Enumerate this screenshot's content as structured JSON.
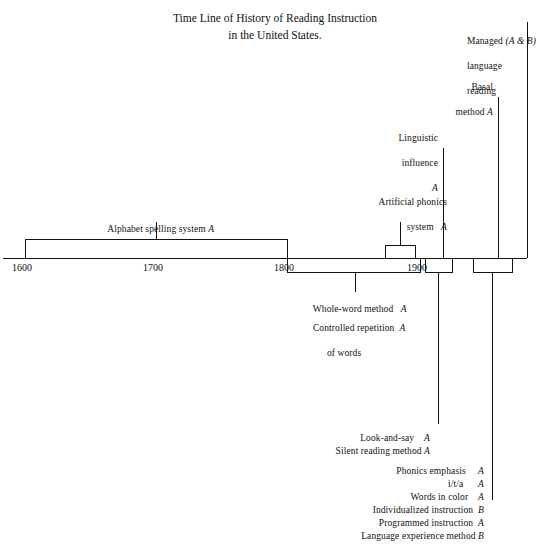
{
  "figure": {
    "title_line1": "Time Line of History of Reading Instruction",
    "title_line2": "in the United States."
  },
  "axis": {
    "ticks": [
      {
        "label": "1600",
        "x": 25
      },
      {
        "label": "1700",
        "x": 156
      },
      {
        "label": "1800",
        "x": 287
      },
      {
        "label": "1900",
        "x": 420
      }
    ]
  },
  "above_axis_entries": [
    {
      "name": "alphabet-spelling-system",
      "label": "Alphabet spelling system",
      "mark": "A",
      "span_from": 1600,
      "span_to": 1800
    },
    {
      "name": "artificial-phonics-system",
      "label_line1": "Artificial phonics",
      "label_line2": "system",
      "mark": "A",
      "span_from": 1870,
      "span_to": 1895
    },
    {
      "name": "linguistic-influence",
      "label_line1": "Linguistic",
      "label_line2": "influence",
      "mark": "A",
      "at_year": 1918
    },
    {
      "name": "basal-method",
      "label_line1": "Basal",
      "label_line2": "method",
      "mark": "A",
      "at_year": 1960
    },
    {
      "name": "managed-language-reading",
      "label_line1": "Managed",
      "label_line2": "language",
      "label_line3": "reading",
      "mark": "(A & B)",
      "at_year": 1982
    }
  ],
  "below_axis_groups": [
    {
      "name": "group-1800-1900",
      "span_from": 1800,
      "span_to": 1900,
      "entries": [
        {
          "label": "Whole-word method",
          "mark": "A"
        },
        {
          "label": "Controlled repetition",
          "mark": "A",
          "label_cont": "of words"
        }
      ]
    },
    {
      "name": "group-early-1900s",
      "span_from": 1904,
      "span_to": 1926,
      "entries": [
        {
          "label": "Look-and-say",
          "mark": "A"
        },
        {
          "label": "Silent reading method",
          "mark": "A"
        }
      ]
    },
    {
      "name": "group-mid-1900s",
      "span_from": 1940,
      "span_to": 1970,
      "entries": [
        {
          "label": "Phonics emphasis",
          "mark": "A"
        },
        {
          "label": "i/t/a",
          "mark": "A"
        },
        {
          "label": "Words in color",
          "mark": "A"
        },
        {
          "label": "Individualized instruction",
          "mark": "B"
        },
        {
          "label": "Programmed instruction",
          "mark": "A"
        },
        {
          "label": "Language experience method",
          "mark": "B"
        }
      ]
    }
  ],
  "colors": {
    "ink": "#111111",
    "background": "#ffffff"
  }
}
